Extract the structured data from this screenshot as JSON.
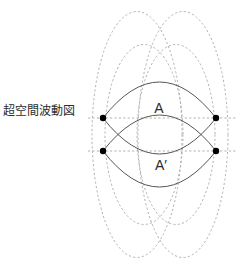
{
  "figure": {
    "caption": "超空間波動図",
    "labels": {
      "upper": "A",
      "lower": "A′"
    },
    "colors": {
      "background": "#ffffff",
      "solid_curve": "#555555",
      "dashed_circle": "#a8a8a8",
      "dashed_axis": "#a8a8a8",
      "node": "#000000",
      "text": "#2b2b2b"
    },
    "geometry": {
      "canvas": {
        "width": 240,
        "height": 269
      },
      "nodes": [
        {
          "name": "node-upper-left",
          "x": 103,
          "y": 118
        },
        {
          "name": "node-upper-right",
          "x": 216,
          "y": 118
        },
        {
          "name": "node-lower-left",
          "x": 103,
          "y": 151
        },
        {
          "name": "node-lower-right",
          "x": 216,
          "y": 151
        }
      ],
      "node_radius": 3.2,
      "dashed_circles": [
        {
          "name": "dashed-circle-left",
          "cx": 137,
          "cy": 134.5,
          "rx": 45,
          "ry": 123
        },
        {
          "name": "dashed-circle-right",
          "cx": 183,
          "cy": 134.5,
          "rx": 45,
          "ry": 123
        }
      ],
      "axis_lines": [
        {
          "name": "axis-line-upper",
          "x1": 88,
          "y1": 118,
          "x2": 236,
          "y2": 118
        },
        {
          "name": "axis-line-lower",
          "x1": 88,
          "y1": 151,
          "x2": 236,
          "y2": 151
        }
      ],
      "lens_upper": {
        "left_x": 103,
        "right_x": 216,
        "axis_y": 118,
        "top_y": 82,
        "bottom_y": 154
      },
      "lens_lower": {
        "left_x": 103,
        "right_x": 216,
        "axis_y": 151,
        "top_y": 115,
        "bottom_y": 187
      }
    }
  }
}
